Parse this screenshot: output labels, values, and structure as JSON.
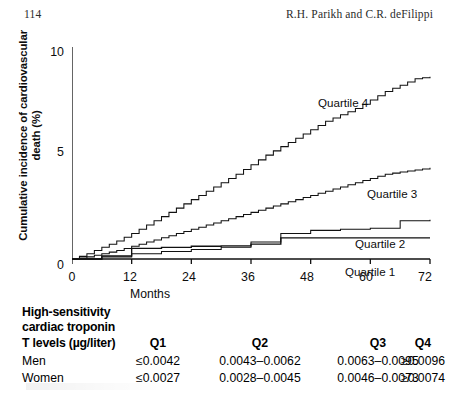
{
  "running_head": {
    "page_number": "114",
    "authors": "R.H. Parikh and C.R. deFilippi"
  },
  "figure": {
    "y_axis_label_line1": "Cumulative incidence of cardiovascular",
    "y_axis_label_line2": "death (%)",
    "x_axis_label": "Months",
    "y_ticks": [
      "0",
      "5",
      "10"
    ],
    "x_ticks": [
      "0",
      "12",
      "24",
      "36",
      "48",
      "60",
      "72"
    ],
    "curve_labels": {
      "q4": "Quartile 4",
      "q3": "Quartile 3",
      "q2": "Quartile 2",
      "q1": "Quartile 1"
    }
  },
  "chart_data": {
    "type": "line",
    "title": "",
    "xlabel": "Months",
    "ylabel": "Cumulative incidence of cardiovascular death (%)",
    "xlim": [
      0,
      72
    ],
    "ylim": [
      0,
      10
    ],
    "xticks": [
      0,
      12,
      24,
      36,
      48,
      60,
      72
    ],
    "yticks": [
      0,
      5,
      10
    ],
    "grid": false,
    "step": "post",
    "legend": "inline-annotations",
    "series": [
      {
        "name": "Quartile 4",
        "x": [
          0,
          3,
          6,
          9,
          12,
          15,
          18,
          21,
          24,
          27,
          30,
          33,
          36,
          39,
          42,
          45,
          48,
          51,
          54,
          57,
          60,
          63,
          66,
          69,
          72
        ],
        "values": [
          0,
          0.25,
          0.55,
          0.85,
          1.2,
          1.6,
          2.0,
          2.4,
          2.8,
          3.2,
          3.6,
          4.0,
          4.45,
          4.9,
          5.3,
          5.7,
          6.1,
          6.5,
          6.8,
          7.1,
          7.5,
          7.9,
          8.2,
          8.5,
          8.6
        ]
      },
      {
        "name": "Quartile 3",
        "x": [
          0,
          3,
          6,
          9,
          12,
          15,
          18,
          21,
          24,
          27,
          30,
          33,
          36,
          39,
          42,
          45,
          48,
          51,
          54,
          57,
          60,
          63,
          66,
          69,
          72
        ],
        "values": [
          0,
          0.1,
          0.25,
          0.4,
          0.6,
          0.8,
          1.0,
          1.2,
          1.4,
          1.6,
          1.8,
          2.0,
          2.2,
          2.4,
          2.6,
          2.8,
          3.0,
          3.2,
          3.4,
          3.6,
          3.8,
          4.0,
          4.1,
          4.2,
          4.3
        ]
      },
      {
        "name": "Quartile 2",
        "x": [
          0,
          6,
          12,
          18,
          24,
          30,
          36,
          42,
          48,
          54,
          60,
          66,
          72
        ],
        "values": [
          0,
          0.1,
          0.25,
          0.35,
          0.45,
          0.55,
          0.8,
          1.2,
          1.35,
          1.4,
          1.45,
          1.8,
          1.85
        ]
      },
      {
        "name": "Quartile 1",
        "x": [
          0,
          6,
          12,
          18,
          24,
          30,
          36,
          42,
          48,
          54,
          60,
          66,
          72
        ],
        "values": [
          0,
          0.15,
          0.5,
          0.55,
          0.6,
          0.62,
          0.7,
          1.0,
          1.0,
          1.0,
          1.0,
          1.0,
          1.0
        ]
      }
    ]
  },
  "table": {
    "header_line1": "High-sensitivity",
    "header_line2": "cardiac troponin",
    "header_line3": "T levels (µg/liter)",
    "columns": [
      "Q1",
      "Q2",
      "Q3",
      "Q4"
    ],
    "rows": [
      {
        "label": "Men",
        "q1": "≤0.0042",
        "q2": "0.0043–0.0062",
        "q3": "0.0063–0.0095",
        "q4": "≥0.0096"
      },
      {
        "label": "Women",
        "q1": "≤0.0027",
        "q2": "0.0028–0.0045",
        "q3": "0.0046–0.0073",
        "q4": "≥0.0074"
      }
    ]
  }
}
